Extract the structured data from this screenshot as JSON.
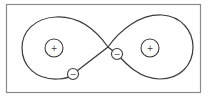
{
  "diagram": {
    "curve": {
      "shape": "figure-eight",
      "color": "#3a3a3a"
    },
    "frame_color": "#8a8a8a",
    "charges": [
      {
        "id": "positive-left",
        "sign": "+",
        "location": "inside left loop"
      },
      {
        "id": "positive-right",
        "sign": "+",
        "location": "inside right loop"
      },
      {
        "id": "negative-lower-left",
        "sign": "−",
        "location": "on curve, lower-left segment"
      },
      {
        "id": "negative-center",
        "sign": "−",
        "location": "on curve, near crossing point"
      }
    ]
  }
}
